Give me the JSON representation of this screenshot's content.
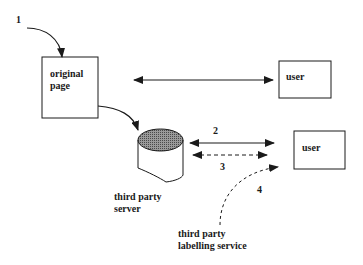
{
  "diagram": {
    "nodes": {
      "original_page": {
        "label_line1": "original",
        "label_line2": "page"
      },
      "user_top": {
        "label": "user"
      },
      "user_bottom": {
        "label": "user"
      },
      "third_party_server": {
        "label_line1": "third party",
        "label_line2": "server"
      },
      "labelling_service": {
        "label_line1": "third party",
        "label_line2": "labelling service"
      }
    },
    "step_labels": {
      "step1": "1",
      "step2": "2",
      "step3": "3",
      "step4": "4"
    },
    "colors": {
      "stroke": "#1a1a1a",
      "cylinder_top": "#777777",
      "background": "#ffffff"
    }
  }
}
